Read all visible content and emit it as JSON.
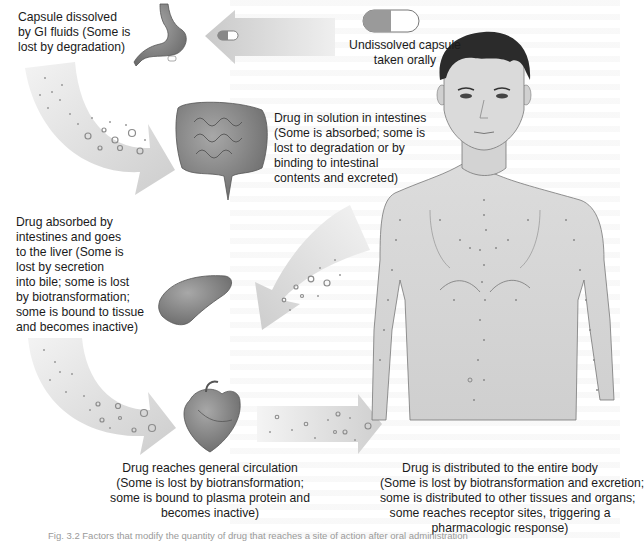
{
  "diagram": {
    "steps": [
      {
        "id": "capsule",
        "label_lines": [
          "Undissolved capsule",
          "taken orally"
        ]
      },
      {
        "id": "stomach",
        "label_lines": [
          "Capsule dissolved",
          "by GI fluids (Some is",
          "lost by degradation)"
        ]
      },
      {
        "id": "intestines",
        "label_lines": [
          "Drug in solution in intestines",
          "(Some is absorbed; some is",
          "lost to degradation or by",
          "binding to intestinal",
          "contents and excreted)"
        ]
      },
      {
        "id": "liver",
        "label_lines": [
          "Drug absorbed by",
          "intestines and goes",
          "to the liver (Some is",
          "lost by secretion",
          "into bile; some is lost",
          "by biotransformation;",
          "some is bound to tissue",
          "and becomes inactive)"
        ]
      },
      {
        "id": "circulation",
        "label_lines": [
          "Drug reaches general circulation",
          "(Some is lost by biotransformation;",
          "some is bound to plasma protein and",
          "becomes inactive)"
        ]
      },
      {
        "id": "body",
        "label_lines": [
          "Drug is distributed to the entire body",
          "(Some is lost by biotransformation and excretion;",
          "some is distributed to other tissues and organs;",
          "some reaches receptor sites, triggering a",
          "pharmacologic response)"
        ]
      }
    ],
    "caption": "Fig. 3.2 Factors that modify the quantity of drug that reaches a site of action after oral administration",
    "colors": {
      "arrow_fill": "#d9d9d9",
      "arrow_light": "#f2f2f2",
      "organ_fill": "#8c8c8c",
      "skin": "#d6d6d6",
      "hair": "#2b2b2b",
      "text": "#1a1a1a"
    },
    "icons": [
      "capsule-icon",
      "stomach-icon",
      "intestines-icon",
      "liver-icon",
      "heart-icon",
      "human-body-icon"
    ]
  }
}
